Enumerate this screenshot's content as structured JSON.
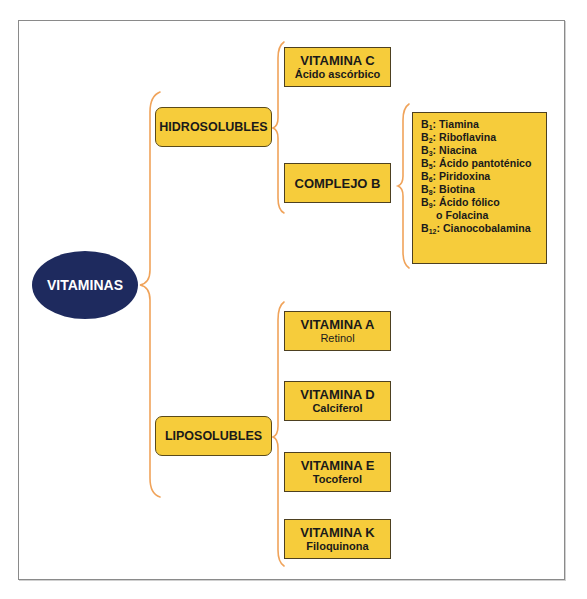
{
  "colors": {
    "root_fill": "#1e2a5e",
    "box_fill": "#f6cc3b",
    "brace_stroke": "#f0a35a",
    "frame_border": "#8a8a8a"
  },
  "root": {
    "label": "VITAMINAS"
  },
  "groups": [
    {
      "label": "HIDROSOLUBLES",
      "children": [
        {
          "title": "VITAMINA C",
          "subtitle": "Ácido ascórbico"
        },
        {
          "title": "COMPLEJO B",
          "items": [
            {
              "prefix": "B",
              "sub": "1",
              "text": ": Tiamina"
            },
            {
              "prefix": "B",
              "sub": "2",
              "text": ": Riboflavina"
            },
            {
              "prefix": "B",
              "sub": "3",
              "text": ": Niacina"
            },
            {
              "prefix": "B",
              "sub": "5",
              "text": ": Ácido pantoténico"
            },
            {
              "prefix": "B",
              "sub": "6",
              "text": ": Piridoxina"
            },
            {
              "prefix": "B",
              "sub": "8",
              "text": ": Biotina"
            },
            {
              "prefix": "B",
              "sub": "9",
              "text": ": Ácido fólico"
            },
            {
              "prefix": "",
              "sub": "",
              "text": "o Folacina"
            },
            {
              "prefix": "B",
              "sub": "12",
              "text": ": Cianocobalamina"
            }
          ]
        }
      ]
    },
    {
      "label": "LIPOSOLUBLES",
      "children": [
        {
          "title": "VITAMINA A",
          "subtitle": "Retinol"
        },
        {
          "title": "VITAMINA D",
          "subtitle": "Calciferol"
        },
        {
          "title": "VITAMINA E",
          "subtitle": "Tocoferol"
        },
        {
          "title": "VITAMINA K",
          "subtitle": "Filoquinona"
        }
      ]
    }
  ]
}
